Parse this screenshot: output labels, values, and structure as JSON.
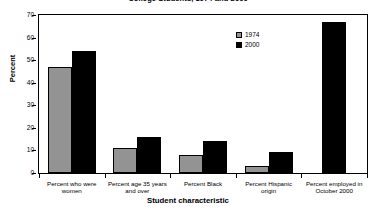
{
  "chart_data": {
    "type": "bar",
    "title": "College Students, 1974 and 2000",
    "xlabel": "Student characteristic",
    "ylabel": "Percent",
    "ylim": [
      0,
      70
    ],
    "yticks": [
      0,
      10,
      20,
      30,
      40,
      50,
      60,
      70
    ],
    "ytick_labels": [
      "0",
      "10",
      "20",
      "30",
      "40",
      "50",
      "60",
      "70"
    ],
    "grid": false,
    "legend_position": "upper-center-right",
    "categories": [
      "Percent who were\nwomen",
      "Percent age 35 years\nand over",
      "Percent Black",
      "Percent Hispanic\norigin",
      "Percent employed in\nOctober 2000"
    ],
    "series": [
      {
        "name": "1974",
        "color": "#939393",
        "values": [
          47,
          11,
          8,
          3,
          null
        ]
      },
      {
        "name": "2000",
        "color": "#000000",
        "values": [
          54,
          16,
          14,
          9.5,
          67
        ]
      }
    ]
  },
  "legend": {
    "entries": [
      {
        "label": "1974",
        "swatch": "1974"
      },
      {
        "label": "2000",
        "swatch": "2000"
      }
    ]
  }
}
